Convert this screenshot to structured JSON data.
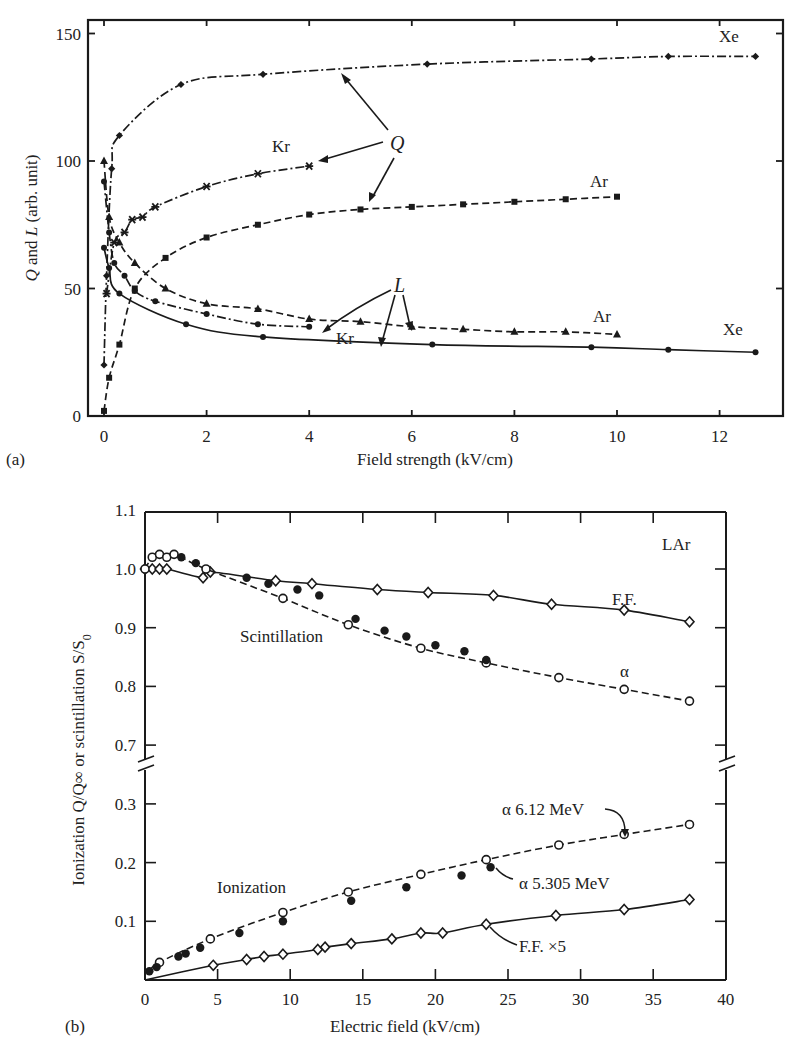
{
  "chart_data": [
    {
      "panel": "(a)",
      "type": "line",
      "xlabel": "Field strength (kV/cm)",
      "ylabel": "Q and L (arb. unit)",
      "xlim": [
        -0.3,
        13.2
      ],
      "ylim": [
        0,
        150
      ],
      "xticks": [
        0,
        2,
        4,
        6,
        8,
        10,
        12
      ],
      "yticks": [
        0,
        50,
        100,
        150
      ],
      "grid": false,
      "legend": "none (inline labels)",
      "annotations": [
        "Xe",
        "Kr",
        "Ar",
        "Q",
        "L",
        "Ar",
        "Kr",
        "Xe"
      ],
      "series": [
        {
          "name": "Q Xe",
          "style": "dash-dot",
          "marker": "diamond",
          "x": [
            0.0,
            0.05,
            0.15,
            0.3,
            1.5,
            3.1,
            6.3,
            9.5,
            11.0,
            12.7
          ],
          "y": [
            20,
            55,
            97,
            110,
            130,
            134,
            138,
            140,
            141,
            141
          ]
        },
        {
          "name": "Q Kr",
          "style": "dash-dot",
          "marker": "asterisk",
          "x": [
            0.05,
            0.2,
            0.4,
            0.55,
            0.75,
            1.0,
            2.0,
            3.0,
            4.0
          ],
          "y": [
            48,
            68,
            72,
            77,
            78,
            82,
            90,
            95,
            98
          ]
        },
        {
          "name": "Q Ar",
          "style": "dashed",
          "marker": "square",
          "x": [
            0.0,
            0.1,
            0.3,
            0.6,
            1.2,
            2.0,
            3.0,
            4.0,
            5.0,
            6.0,
            7.0,
            8.0,
            9.0,
            10.0
          ],
          "y": [
            2,
            15,
            28,
            50,
            62,
            70,
            75,
            79,
            81,
            82,
            83,
            84,
            85,
            86
          ]
        },
        {
          "name": "L Ar",
          "style": "dashed",
          "marker": "triangle",
          "x": [
            0.0,
            0.1,
            0.3,
            0.6,
            1.2,
            2.0,
            3.0,
            4.0,
            5.0,
            6.0,
            7.0,
            8.0,
            9.0,
            10.0
          ],
          "y": [
            100,
            78,
            68,
            60,
            50,
            44,
            42,
            38,
            37,
            35,
            34,
            33,
            33,
            32
          ]
        },
        {
          "name": "L Kr",
          "style": "dash-dot",
          "marker": "circle",
          "x": [
            0.0,
            0.1,
            0.2,
            0.4,
            0.6,
            1.0,
            2.0,
            3.0,
            4.0
          ],
          "y": [
            92,
            72,
            60,
            55,
            49,
            45,
            40,
            36,
            35
          ]
        },
        {
          "name": "L Xe",
          "style": "solid",
          "marker": "circle",
          "x": [
            0.0,
            0.1,
            0.3,
            1.6,
            3.1,
            6.4,
            9.5,
            11.0,
            12.7
          ],
          "y": [
            66,
            58,
            48,
            36,
            31,
            28,
            27,
            26,
            25
          ]
        }
      ]
    },
    {
      "panel": "(b)",
      "type": "scatter",
      "xlabel": "Electric field (kV/cm)",
      "ylabel": "Ionization Q/Q∞ or scintillation S/S0",
      "xlim": [
        0,
        40
      ],
      "ylim_upper": [
        0.65,
        1.1
      ],
      "ylim_lower": [
        0,
        0.35
      ],
      "axis_break": "between 0.3 and 0.7",
      "xticks": [
        0,
        5,
        10,
        15,
        20,
        25,
        30,
        35,
        40
      ],
      "yticks": [
        0.1,
        0.2,
        0.3,
        0.7,
        0.8,
        0.9,
        1.0,
        1.1
      ],
      "grid": false,
      "annotations": [
        "LAr",
        "F.F.",
        "Scintillation",
        "α",
        "Ionization",
        "α 6.12 MeV",
        "α 5.305 MeV",
        "F.F. ×5"
      ],
      "series": [
        {
          "name": "Scintillation F.F.",
          "group": "scintillation",
          "style": "solid",
          "marker": "open-diamond",
          "x": [
            0,
            0.5,
            1.0,
            1.5,
            4.0,
            4.5,
            9.0,
            11.5,
            16.0,
            19.5,
            24.0,
            28.0,
            33.0,
            37.5
          ],
          "y": [
            1.0,
            1.0,
            1.0,
            1.0,
            0.985,
            0.995,
            0.98,
            0.975,
            0.965,
            0.96,
            0.955,
            0.94,
            0.93,
            0.91
          ]
        },
        {
          "name": "Scintillation α (open)",
          "group": "scintillation",
          "style": "dashed",
          "marker": "open-circle",
          "x": [
            0,
            0.5,
            1.0,
            1.5,
            2.0,
            4.2,
            9.5,
            14.0,
            19.0,
            23.5,
            28.5,
            33.0,
            37.5
          ],
          "y": [
            1.0,
            1.02,
            1.025,
            1.02,
            1.025,
            1.0,
            0.95,
            0.905,
            0.865,
            0.84,
            0.815,
            0.795,
            0.775
          ]
        },
        {
          "name": "Scintillation α (filled)",
          "group": "scintillation",
          "style": "none",
          "marker": "filled-circle",
          "x": [
            2.5,
            3.5,
            7.0,
            8.5,
            10.5,
            12.0,
            14.5,
            16.5,
            18.0,
            20.0,
            22.0,
            23.5
          ],
          "y": [
            1.02,
            1.01,
            0.985,
            0.975,
            0.965,
            0.955,
            0.915,
            0.895,
            0.885,
            0.87,
            0.86,
            0.845
          ]
        },
        {
          "name": "α 6.12 MeV",
          "group": "ionization",
          "style": "dashed",
          "marker": "open-circle",
          "x": [
            1.0,
            4.5,
            9.5,
            14.0,
            19.0,
            23.5,
            28.5,
            33.0,
            37.5
          ],
          "y": [
            0.03,
            0.07,
            0.115,
            0.15,
            0.18,
            0.205,
            0.23,
            0.248,
            0.265
          ]
        },
        {
          "name": "α 5.305 MeV",
          "group": "ionization",
          "style": "none",
          "marker": "filled-circle",
          "x": [
            0.3,
            0.8,
            2.3,
            2.8,
            3.8,
            6.5,
            9.5,
            14.2,
            18.0,
            21.8,
            23.8
          ],
          "y": [
            0.015,
            0.022,
            0.04,
            0.045,
            0.055,
            0.08,
            0.1,
            0.135,
            0.158,
            0.178,
            0.192
          ]
        },
        {
          "name": "F.F. ×5",
          "group": "ionization",
          "style": "solid",
          "marker": "open-diamond",
          "x": [
            4.7,
            7.0,
            8.2,
            9.5,
            11.9,
            12.4,
            14.2,
            17.0,
            19.0,
            20.5,
            23.5,
            28.3,
            33.0,
            37.5
          ],
          "y": [
            0.025,
            0.035,
            0.04,
            0.044,
            0.052,
            0.056,
            0.062,
            0.07,
            0.08,
            0.08,
            0.095,
            0.11,
            0.12,
            0.137
          ]
        }
      ]
    }
  ],
  "panels": {
    "a": {
      "label": "(a)",
      "xlabel": "Field strength (kV/cm)",
      "ylabel_q": "Q",
      "ylabel_and": " and ",
      "ylabel_l": "L",
      "ylabel_rest": " (arb. unit)",
      "xticks": [
        "0",
        "2",
        "4",
        "6",
        "8",
        "10",
        "12"
      ],
      "yticks": [
        "0",
        "50",
        "100",
        "150"
      ],
      "anno": {
        "xe_q": "Xe",
        "kr_q": "Kr",
        "ar_q": "Ar",
        "q": "Q",
        "l": "L",
        "ar_l": "Ar",
        "kr_l": "Kr",
        "xe_l": "Xe"
      }
    },
    "b": {
      "label": "(b)",
      "xlabel": "Electric field (kV/cm)",
      "ylabel": "Ionization Q/Q∞ or scintillation S/S",
      "ylabel_sub": "0",
      "xticks": [
        "0",
        "5",
        "10",
        "15",
        "20",
        "25",
        "30",
        "35",
        "40"
      ],
      "yticks_upper": [
        "0.7",
        "0.8",
        "0.9",
        "1.0",
        "1.1"
      ],
      "yticks_lower": [
        "0.1",
        "0.2",
        "0.3"
      ],
      "anno": {
        "lar": "LAr",
        "ff": "F.F.",
        "scint": "Scintillation",
        "alpha": "α",
        "ion": "Ionization",
        "a612": "α 6.12 MeV",
        "a5305": "α 5.305 MeV",
        "ffx5": "F.F. ×5"
      }
    }
  }
}
